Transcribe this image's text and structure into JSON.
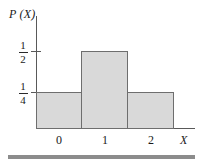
{
  "figure": {
    "y_axis_label": "P (X)",
    "x_axis_label": "X",
    "y_tick_labels": [
      {
        "numerator": "1",
        "denominator": "2"
      },
      {
        "numerator": "1",
        "denominator": "4"
      }
    ],
    "x_tick_labels": [
      "0",
      "1",
      "2"
    ],
    "colors": {
      "bar_fill": "#d9d9d9",
      "bar_stroke": "#6e6e6e",
      "axis": "#595959",
      "rule": "#8c8c8c",
      "text": "#1a1a1a"
    }
  },
  "chart_data": {
    "type": "bar",
    "title": "",
    "subtitle": "",
    "xlabel": "X",
    "ylabel": "P (X)",
    "categories": [
      "0",
      "1",
      "2"
    ],
    "values": [
      0.25,
      0.5,
      0.25
    ],
    "value_labels": [
      "1/4",
      "1/2",
      "1/4"
    ],
    "ytick_values": [
      0.25,
      0.5
    ],
    "ytick_labels": [
      "1/4",
      "1/2"
    ],
    "xtick_values": [
      0,
      1,
      2
    ],
    "xtick_labels": [
      "0",
      "1",
      "2"
    ],
    "ylim": [
      0,
      0.625
    ],
    "xlim": [
      -0.5,
      2.5
    ],
    "grid": false,
    "legend": null,
    "annotations": []
  }
}
